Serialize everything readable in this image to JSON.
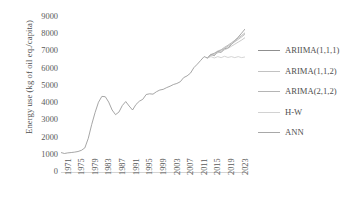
{
  "chart_data": {
    "type": "line",
    "title": "",
    "xlabel": "",
    "ylabel": "Energy use (kg of oil eq./capita)",
    "ylim": [
      0,
      9000
    ],
    "yticks": [
      0,
      1000,
      2000,
      3000,
      4000,
      5000,
      6000,
      7000,
      8000,
      9000
    ],
    "ytick_labels": [
      "0",
      "1000",
      "2000",
      "3000",
      "4000",
      "5000",
      "6000",
      "7000",
      "8000",
      "9000"
    ],
    "xlim": [
      1971,
      2025
    ],
    "xticks": [
      1971,
      1975,
      1979,
      1983,
      1987,
      1991,
      1995,
      1999,
      2003,
      2007,
      2011,
      2015,
      2019,
      2023
    ],
    "xtick_labels": [
      "1971",
      "1975",
      "1979",
      "1983",
      "1987",
      "1991",
      "1995",
      "1999",
      "2003",
      "2007",
      "2011",
      "2015",
      "2019",
      "2023"
    ],
    "grid": false,
    "legend_position": "right",
    "x": [
      1971,
      1972,
      1973,
      1974,
      1975,
      1976,
      1977,
      1978,
      1979,
      1980,
      1981,
      1982,
      1983,
      1984,
      1985,
      1986,
      1987,
      1988,
      1989,
      1990,
      1991,
      1992,
      1993,
      1994,
      1995,
      1996,
      1997,
      1998,
      1999,
      2000,
      2001,
      2002,
      2003,
      2004,
      2005,
      2006,
      2007,
      2008,
      2009,
      2010,
      2011,
      2012,
      2013,
      2014,
      2015,
      2016,
      2017,
      2018,
      2019,
      2020,
      2021,
      2022,
      2023,
      2024,
      2025
    ],
    "series": [
      {
        "name": "ARIIMA(1,1,1)",
        "color": "#8f8f8f",
        "values": [
          1130,
          1075,
          1110,
          1130,
          1155,
          1190,
          1260,
          1400,
          1950,
          2750,
          3450,
          4050,
          4390,
          4370,
          4060,
          3600,
          3330,
          3480,
          3860,
          4090,
          3830,
          3600,
          3920,
          4110,
          4220,
          4500,
          4540,
          4520,
          4660,
          4760,
          4800,
          4900,
          4980,
          5080,
          5140,
          5240,
          5480,
          5580,
          5740,
          6060,
          6260,
          6480,
          6700,
          6620,
          6840,
          6750,
          7000,
          6940,
          7160,
          7200,
          7400,
          7620,
          7830,
          8060,
          8300
        ]
      },
      {
        "name": "ARIMA(1,1,2)",
        "color": "#b3b3b3",
        "values": [
          null,
          null,
          null,
          null,
          null,
          null,
          null,
          null,
          null,
          null,
          null,
          null,
          null,
          null,
          null,
          null,
          null,
          null,
          null,
          null,
          null,
          null,
          null,
          null,
          null,
          null,
          null,
          null,
          null,
          null,
          null,
          null,
          null,
          null,
          null,
          null,
          null,
          null,
          null,
          null,
          null,
          null,
          null,
          6620,
          6800,
          6880,
          6980,
          7060,
          7180,
          7300,
          7430,
          7560,
          7700,
          7840,
          8000
        ]
      },
      {
        "name": "ARIMA(2,1,2)",
        "color": "#a8a8a8",
        "values": [
          null,
          null,
          null,
          null,
          null,
          null,
          null,
          null,
          null,
          null,
          null,
          null,
          null,
          null,
          null,
          null,
          null,
          null,
          null,
          null,
          null,
          null,
          null,
          null,
          null,
          null,
          null,
          null,
          null,
          null,
          null,
          null,
          null,
          null,
          null,
          null,
          null,
          null,
          null,
          null,
          null,
          null,
          null,
          6620,
          6820,
          6900,
          7020,
          7100,
          7240,
          7360,
          7500,
          7640,
          7780,
          7920,
          8080
        ]
      },
      {
        "name": "H-W",
        "color": "#c9c9c9",
        "values": [
          null,
          null,
          null,
          null,
          null,
          null,
          null,
          null,
          null,
          null,
          null,
          null,
          null,
          null,
          null,
          null,
          null,
          null,
          null,
          null,
          null,
          null,
          null,
          null,
          null,
          null,
          null,
          null,
          null,
          null,
          null,
          null,
          null,
          null,
          null,
          null,
          null,
          null,
          null,
          null,
          null,
          null,
          null,
          6620,
          6700,
          6620,
          6700,
          6640,
          6720,
          6650,
          6700,
          6640,
          6700,
          6640,
          6680
        ]
      },
      {
        "name": "ANN",
        "color": "#bdbdbd",
        "values": [
          null,
          null,
          null,
          null,
          null,
          null,
          null,
          null,
          null,
          null,
          null,
          null,
          null,
          null,
          null,
          null,
          null,
          null,
          null,
          null,
          null,
          null,
          null,
          null,
          null,
          null,
          null,
          null,
          null,
          null,
          null,
          null,
          null,
          null,
          null,
          null,
          null,
          null,
          null,
          null,
          null,
          null,
          null,
          6620,
          6760,
          6820,
          6920,
          6980,
          7100,
          7180,
          7300,
          7420,
          7540,
          7660,
          7800
        ]
      }
    ]
  },
  "legend": {
    "items": [
      {
        "label": "ARIIMA(1,1,1)",
        "color": "#8f8f8f"
      },
      {
        "label": "ARIMA(1,1,2)",
        "color": "#c2c2c2"
      },
      {
        "label": "ARIMA(2,1,2)",
        "color": "#b5b5b5"
      },
      {
        "label": "H-W",
        "color": "#d2d2d2"
      },
      {
        "label": "ANN",
        "color": "#a8a8a8"
      }
    ]
  }
}
